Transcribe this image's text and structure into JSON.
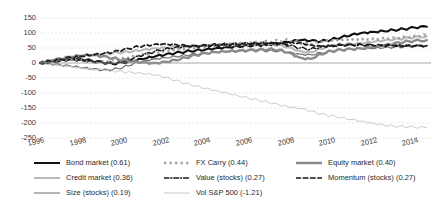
{
  "chart_data": {
    "type": "line",
    "title": "",
    "xlabel": "",
    "ylabel": "",
    "xlim": [
      1996,
      2014.8
    ],
    "ylim": [
      -250,
      150
    ],
    "ytick_labels": [
      "150",
      "100",
      "50",
      "0",
      "-50",
      "-100",
      "-150",
      "-200",
      "-250"
    ],
    "ytick_values": [
      150,
      100,
      50,
      0,
      -50,
      -100,
      -150,
      -200,
      -250
    ],
    "xtick_labels": [
      "1996",
      "1998",
      "2000",
      "2002",
      "2004",
      "2006",
      "2008",
      "2010",
      "2012",
      "2014"
    ],
    "xtick_values": [
      1996,
      1998,
      2000,
      2002,
      2004,
      2006,
      2008,
      2010,
      2012,
      2014
    ],
    "grid": true,
    "zero_line": true,
    "legend_position": "below",
    "series": [
      {
        "name": "Bond market",
        "sharpe": "0.61",
        "legend_label": "Bond market (0.61)",
        "color": "#111111",
        "style": "solid",
        "width": 2.1,
        "x": [
          1996,
          1996.5,
          1997,
          1997.5,
          1998,
          1998.5,
          1999,
          1999.5,
          2000,
          2000.5,
          2001,
          2001.5,
          2002,
          2002.5,
          2003,
          2003.5,
          2004,
          2004.5,
          2005,
          2005.5,
          2006,
          2006.5,
          2007,
          2007.5,
          2008,
          2008.5,
          2009,
          2009.5,
          2010,
          2010.5,
          2011,
          2011.5,
          2012,
          2012.5,
          2013,
          2013.5,
          2014,
          2014.6
        ],
        "y": [
          0,
          4,
          9,
          13,
          10,
          6,
          2,
          -2,
          1,
          7,
          14,
          21,
          27,
          33,
          38,
          42,
          46,
          50,
          53,
          56,
          58,
          60,
          62,
          65,
          70,
          76,
          74,
          72,
          78,
          86,
          95,
          101,
          104,
          107,
          110,
          113,
          118,
          121
        ]
      },
      {
        "name": "Credit market",
        "sharpe": "0.36",
        "legend_label": "Credit market (0.36)",
        "color": "#b9b9b9",
        "style": "solid",
        "width": 2.1,
        "x": [
          1996,
          1996.5,
          1997,
          1997.5,
          1998,
          1998.5,
          1999,
          1999.5,
          2000,
          2000.5,
          2001,
          2001.5,
          2002,
          2002.5,
          2003,
          2003.5,
          2004,
          2004.5,
          2005,
          2005.5,
          2006,
          2006.5,
          2007,
          2007.5,
          2008,
          2008.5,
          2009,
          2009.5,
          2010,
          2010.5,
          2011,
          2011.5,
          2012,
          2012.5,
          2013,
          2013.5,
          2014,
          2014.6
        ],
        "y": [
          0,
          6,
          12,
          18,
          22,
          26,
          30,
          33,
          36,
          40,
          45,
          49,
          52,
          54,
          56,
          57,
          58,
          59,
          59,
          60,
          61,
          62,
          62,
          60,
          52,
          40,
          36,
          48,
          58,
          62,
          63,
          65,
          70,
          74,
          78,
          82,
          86,
          89
        ]
      },
      {
        "name": "Size (stocks)",
        "sharpe": "0.19",
        "legend_label": "Size (stocks) (0.19)",
        "color": "#6d6d6d",
        "style": "solid",
        "width": 1.2,
        "x": [
          1996,
          1996.5,
          1997,
          1997.5,
          1998,
          1998.5,
          1999,
          1999.5,
          2000,
          2000.5,
          2001,
          2001.5,
          2002,
          2002.5,
          2003,
          2003.5,
          2004,
          2004.5,
          2005,
          2005.5,
          2006,
          2006.5,
          2007,
          2007.5,
          2008,
          2008.5,
          2009,
          2009.5,
          2010,
          2010.5,
          2011,
          2011.5,
          2012,
          2012.5,
          2013,
          2013.5,
          2014,
          2014.6
        ],
        "y": [
          0,
          -3,
          -7,
          -11,
          -16,
          -20,
          -24,
          -22,
          -14,
          -2,
          8,
          14,
          18,
          22,
          26,
          30,
          33,
          35,
          37,
          38,
          40,
          41,
          41,
          40,
          36,
          30,
          28,
          34,
          40,
          43,
          45,
          46,
          48,
          50,
          52,
          54,
          56,
          58
        ]
      },
      {
        "name": "FX Carry",
        "sharpe": "0.44",
        "legend_label": "FX Carry (0.44)",
        "color": "#a0a0a0",
        "style": "dotted",
        "width": 2.4,
        "x": [
          1996,
          1996.5,
          1997,
          1997.5,
          1998,
          1998.5,
          1999,
          1999.5,
          2000,
          2000.5,
          2001,
          2001.5,
          2002,
          2002.5,
          2003,
          2003.5,
          2004,
          2004.5,
          2005,
          2005.5,
          2006,
          2006.5,
          2007,
          2007.5,
          2008,
          2008.5,
          2009,
          2009.5,
          2010,
          2010.5,
          2011,
          2011.5,
          2012,
          2012.5,
          2013,
          2013.5,
          2014,
          2014.6
        ],
        "y": [
          0,
          5,
          10,
          14,
          12,
          8,
          6,
          10,
          16,
          22,
          28,
          33,
          38,
          43,
          48,
          52,
          56,
          59,
          62,
          65,
          68,
          70,
          72,
          74,
          76,
          66,
          62,
          70,
          74,
          76,
          78,
          79,
          81,
          83,
          85,
          87,
          90,
          92
        ]
      },
      {
        "name": "Value (stocks)",
        "sharpe": "0.27",
        "legend_label": "Value (stocks) (0.27)",
        "color": "#1a1a1a",
        "style": "dashdot",
        "width": 1.5,
        "x": [
          1996,
          1996.5,
          1997,
          1997.5,
          1998,
          1998.5,
          1999,
          1999.5,
          2000,
          2000.5,
          2001,
          2001.5,
          2002,
          2002.5,
          2003,
          2003.5,
          2004,
          2004.5,
          2005,
          2005.5,
          2006,
          2006.5,
          2007,
          2007.5,
          2008,
          2008.5,
          2009,
          2009.5,
          2010,
          2010.5,
          2011,
          2011.5,
          2012,
          2012.5,
          2013,
          2013.5,
          2014,
          2014.6
        ],
        "y": [
          0,
          8,
          14,
          18,
          14,
          8,
          2,
          -4,
          4,
          16,
          28,
          38,
          46,
          52,
          56,
          58,
          60,
          62,
          63,
          64,
          65,
          66,
          66,
          64,
          58,
          50,
          46,
          54,
          58,
          60,
          61,
          60,
          59,
          58,
          58,
          57,
          56,
          57
        ]
      },
      {
        "name": "Vol S&P 500",
        "sharpe": "-1.21",
        "legend_label": "Vol S&P 500 (-1.21)",
        "color": "#c4c4c4",
        "style": "solid",
        "width": 0.9,
        "x": [
          1996,
          1996.5,
          1997,
          1997.5,
          1998,
          1998.5,
          1999,
          1999.5,
          2000,
          2000.5,
          2001,
          2001.5,
          2002,
          2002.5,
          2003,
          2003.5,
          2004,
          2004.5,
          2005,
          2005.5,
          2006,
          2006.5,
          2007,
          2007.5,
          2008,
          2008.5,
          2009,
          2009.5,
          2010,
          2010.5,
          2011,
          2011.5,
          2012,
          2012.5,
          2013,
          2013.5,
          2014,
          2014.6
        ],
        "y": [
          0,
          -4,
          -8,
          -12,
          -16,
          -20,
          -22,
          -26,
          -30,
          -33,
          -36,
          -40,
          -48,
          -58,
          -68,
          -76,
          -84,
          -92,
          -100,
          -108,
          -116,
          -124,
          -132,
          -140,
          -148,
          -152,
          -160,
          -170,
          -176,
          -182,
          -188,
          -194,
          -200,
          -206,
          -210,
          -212,
          -214,
          -216
        ]
      },
      {
        "name": "Equity market",
        "sharpe": "0.40",
        "legend_label": "Equity market (0.40)",
        "color": "#8a8a8a",
        "style": "solid",
        "width": 2.4,
        "x": [
          1996,
          1996.5,
          1997,
          1997.5,
          1998,
          1998.5,
          1999,
          1999.5,
          2000,
          2000.5,
          2001,
          2001.5,
          2002,
          2002.5,
          2003,
          2003.5,
          2004,
          2004.5,
          2005,
          2005.5,
          2006,
          2006.5,
          2007,
          2007.5,
          2008,
          2008.5,
          2009,
          2009.5,
          2010,
          2010.5,
          2011,
          2011.5,
          2012,
          2012.5,
          2013,
          2013.5,
          2014,
          2014.6
        ],
        "y": [
          0,
          7,
          14,
          20,
          24,
          26,
          22,
          16,
          10,
          6,
          2,
          0,
          4,
          10,
          18,
          26,
          32,
          36,
          38,
          40,
          42,
          44,
          46,
          44,
          34,
          18,
          14,
          30,
          40,
          44,
          46,
          48,
          52,
          58,
          64,
          70,
          74,
          76
        ]
      },
      {
        "name": "Momentum (stocks)",
        "sharpe": "0.27",
        "legend_label": "Momentum (stocks) (0.27)",
        "color": "#1a1a1a",
        "style": "dashed",
        "width": 1.7,
        "x": [
          1996,
          1996.5,
          1997,
          1997.5,
          1998,
          1998.5,
          1999,
          1999.5,
          2000,
          2000.5,
          2001,
          2001.5,
          2002,
          2002.5,
          2003,
          2003.5,
          2004,
          2004.5,
          2005,
          2005.5,
          2006,
          2006.5,
          2007,
          2007.5,
          2008,
          2008.5,
          2009,
          2009.5,
          2010,
          2010.5,
          2011,
          2011.5,
          2012,
          2012.5,
          2013,
          2013.5,
          2014,
          2014.6
        ],
        "y": [
          0,
          6,
          12,
          18,
          22,
          26,
          30,
          36,
          44,
          52,
          58,
          62,
          64,
          62,
          58,
          56,
          56,
          58,
          59,
          60,
          61,
          62,
          63,
          64,
          66,
          68,
          60,
          56,
          58,
          60,
          61,
          60,
          59,
          58,
          58,
          57,
          57,
          58
        ]
      }
    ]
  },
  "legend": {
    "columns": [
      [
        "Bond market (0.61)",
        "Credit market (0.36)",
        "Size (stocks) (0.19)"
      ],
      [
        "FX Carry (0.44)",
        "Value (stocks) (0.27)",
        "Vol S&P 500 (-1.21)"
      ],
      [
        "Equity market (0.40)",
        "Momentum (stocks) (0.27)"
      ]
    ]
  }
}
